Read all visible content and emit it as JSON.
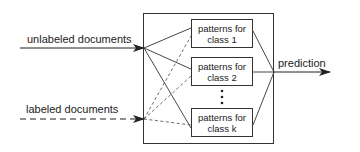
{
  "diagram": {
    "inputs": {
      "unlabeled": {
        "label": "unlabeled documents",
        "line_style": "solid"
      },
      "labeled": {
        "label": "labeled documents",
        "line_style": "dashed"
      }
    },
    "classes": [
      {
        "line1": "patterns for",
        "line2": "class 1"
      },
      {
        "line1": "patterns for",
        "line2": "class 2"
      },
      {
        "line1": "patterns for",
        "line2": "class k"
      }
    ],
    "ellipsis": "⋮",
    "output": {
      "label": "prediction"
    },
    "colors": {
      "stroke": "#333333",
      "text": "#222222",
      "background": "#ffffff"
    }
  }
}
